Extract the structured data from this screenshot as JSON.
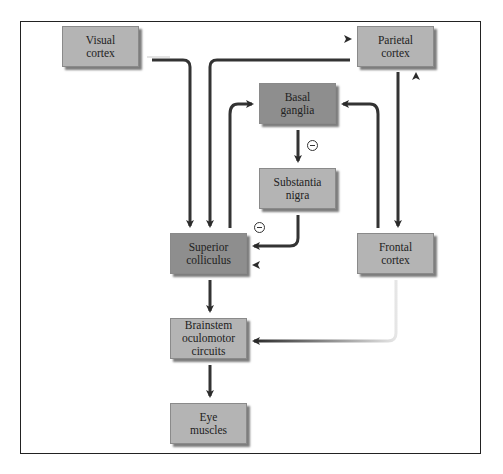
{
  "diagram": {
    "nodes": [
      {
        "id": "visual-cortex",
        "label": "Visual\ncortex"
      },
      {
        "id": "parietal-cortex",
        "label": "Parietal\ncortex"
      },
      {
        "id": "basal-ganglia",
        "label": "Basal\nganglia"
      },
      {
        "id": "substantia-nigra",
        "label": "Substantia\nnigra"
      },
      {
        "id": "superior-colliculus",
        "label": "Superior\ncolliculus"
      },
      {
        "id": "frontal-cortex",
        "label": "Frontal\ncortex"
      },
      {
        "id": "brainstem",
        "label": "Brainstem\noculomotor\ncircuits"
      },
      {
        "id": "eye-muscles",
        "label": "Eye\nmuscles"
      }
    ],
    "edges": [
      {
        "from": "visual-cortex",
        "to": "parietal-cortex"
      },
      {
        "from": "visual-cortex",
        "to": "superior-colliculus"
      },
      {
        "from": "parietal-cortex",
        "to": "superior-colliculus"
      },
      {
        "from": "parietal-cortex",
        "to": "frontal-cortex"
      },
      {
        "from": "frontal-cortex",
        "to": "parietal-cortex"
      },
      {
        "from": "superior-colliculus",
        "to": "basal-ganglia"
      },
      {
        "from": "frontal-cortex",
        "to": "basal-ganglia"
      },
      {
        "from": "basal-ganglia",
        "to": "substantia-nigra",
        "sign": "inhibitory"
      },
      {
        "from": "substantia-nigra",
        "to": "superior-colliculus",
        "sign": "inhibitory"
      },
      {
        "from": "frontal-cortex",
        "to": "superior-colliculus"
      },
      {
        "from": "superior-colliculus",
        "to": "brainstem"
      },
      {
        "from": "frontal-cortex",
        "to": "brainstem"
      },
      {
        "from": "brainstem",
        "to": "eye-muscles"
      }
    ],
    "inhibitory_symbol": "−"
  }
}
